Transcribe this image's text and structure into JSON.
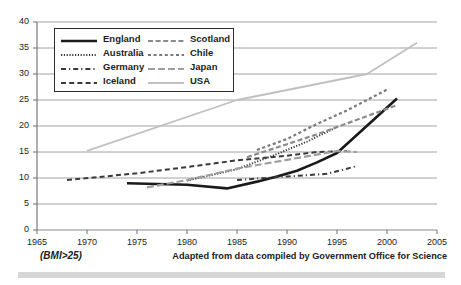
{
  "footer": {
    "note": "(BMI>25)",
    "source": "Adapted from data compiled by Government Office for Science"
  },
  "axes": {
    "y_ticks": [
      "0",
      "5",
      "10",
      "15",
      "20",
      "25",
      "30",
      "35",
      "40"
    ],
    "x_ticks": [
      "1965",
      "1970",
      "1975",
      "1980",
      "1985",
      "1990",
      "1995",
      "2000",
      "2005"
    ]
  },
  "legend": {
    "left": [
      {
        "label": "England",
        "style": "solid-thick-black",
        "color": "#1a1a1a"
      },
      {
        "label": "Australia",
        "style": "fine-dotted",
        "color": "#3a3a3a"
      },
      {
        "label": "Germany",
        "style": "dash-dot",
        "color": "#3a3a3a"
      },
      {
        "label": "Iceland",
        "style": "dashed",
        "color": "#3a3a3a"
      }
    ],
    "right": [
      {
        "label": "Scotland",
        "style": "dashed-gray",
        "color": "#8a8a8a"
      },
      {
        "label": "Chile",
        "style": "dotted-gray",
        "color": "#7a7a7a"
      },
      {
        "label": "Japan",
        "style": "long-dash-gray",
        "color": "#9e9e9e"
      },
      {
        "label": "USA",
        "style": "solid-light-gray",
        "color": "#c0c0c0"
      }
    ]
  },
  "chart_data": {
    "type": "line",
    "title": "",
    "subtitle": "",
    "xlabel": "",
    "ylabel": "",
    "xlim": [
      1965,
      2005
    ],
    "ylim": [
      0,
      40
    ],
    "grid": true,
    "legend_position": "top-left-inside",
    "annotation": "(BMI>25)",
    "source": "Adapted from data compiled by Government Office for Science",
    "series": [
      {
        "name": "England",
        "color": "#1a1a1a",
        "style": "solid-thick-black",
        "x": [
          1974,
          1980,
          1984,
          1987,
          1989,
          1991,
          1993,
          1995,
          2001
        ],
        "y": [
          9.0,
          8.7,
          8.0,
          9.3,
          10.3,
          11.4,
          13.0,
          14.8,
          25.3
        ]
      },
      {
        "name": "Australia",
        "color": "#3a3a3a",
        "style": "fine-dotted",
        "x": [
          1980,
          1985,
          1989,
          1992,
          1995
        ],
        "y": [
          9.5,
          11.7,
          14.6,
          17.0,
          19.8
        ]
      },
      {
        "name": "Germany",
        "color": "#3a3a3a",
        "style": "dash-dot",
        "x": [
          1985,
          1990,
          1994,
          1997
        ],
        "y": [
          9.6,
          10.3,
          10.8,
          12.3
        ]
      },
      {
        "name": "Iceland",
        "color": "#3a3a3a",
        "style": "dashed",
        "x": [
          1968,
          1975,
          1980,
          1985,
          1990,
          1993,
          1996
        ],
        "y": [
          9.6,
          10.9,
          12.1,
          13.4,
          14.3,
          15.0,
          15.2
        ]
      },
      {
        "name": "Scotland",
        "color": "#8a8a8a",
        "style": "dashed-gray",
        "x": [
          1986,
          1990,
          1993,
          1996,
          2001
        ],
        "y": [
          14.0,
          16.5,
          18.4,
          20.5,
          24.0
        ]
      },
      {
        "name": "Chile",
        "color": "#7a7a7a",
        "style": "dotted-gray",
        "x": [
          1987,
          1990,
          1993,
          1996,
          2000
        ],
        "y": [
          15.4,
          17.5,
          20.4,
          23.0,
          27.0
        ]
      },
      {
        "name": "Japan",
        "color": "#9e9e9e",
        "style": "long-dash-gray",
        "x": [
          1976,
          1980,
          1985,
          1990,
          1995,
          1997
        ],
        "y": [
          8.2,
          9.6,
          11.8,
          13.5,
          15.2,
          15.0
        ]
      },
      {
        "name": "USA",
        "color": "#c0c0c0",
        "style": "solid-light-gray",
        "x": [
          1970,
          1985,
          1998,
          2003
        ],
        "y": [
          15.2,
          25.0,
          30.0,
          36.0
        ]
      }
    ]
  }
}
